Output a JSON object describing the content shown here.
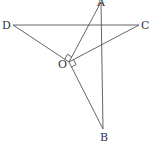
{
  "diagram": {
    "type": "geometry",
    "stroke_color": "#555555",
    "label_color": "#333333",
    "background": "#ffffff",
    "points": {
      "A": {
        "label": "A",
        "x": 101,
        "y": 2
      },
      "B": {
        "label": "B",
        "x": 103,
        "y": 129
      },
      "C": {
        "label": "C",
        "x": 139,
        "y": 25
      },
      "D": {
        "label": "D",
        "x": 13,
        "y": 25
      },
      "O": {
        "label": "O",
        "x": 69,
        "y": 62
      }
    },
    "segments": [
      "DC",
      "AB",
      "OD",
      "OC",
      "OA",
      "OB"
    ],
    "right_angles": [
      "DOA",
      "COB"
    ]
  }
}
